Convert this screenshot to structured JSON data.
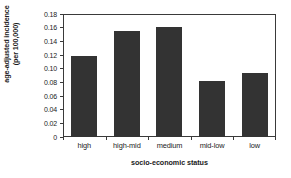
{
  "chart_data": {
    "type": "bar",
    "title": "",
    "xlabel": "socio-economic status",
    "ylabel_line1": "age-adjusted incidence",
    "ylabel_line2": "(per 100,000)",
    "categories": [
      "high",
      "high-mid",
      "medium",
      "mid-low",
      "low"
    ],
    "values": [
      0.118,
      0.155,
      0.161,
      0.082,
      0.094
    ],
    "ylim": [
      0,
      0.18
    ],
    "ytick_labels": [
      "0.18",
      "0.16",
      "0.14",
      "0.12",
      "0.10",
      "0.08",
      "0.06",
      "0.04",
      "0.02",
      "0"
    ],
    "ytick_values": [
      0.18,
      0.16,
      0.14,
      0.12,
      0.1,
      0.08,
      0.06,
      0.04,
      0.02,
      0
    ],
    "grid": false,
    "legend": false,
    "legend_position": "none",
    "bar_color": "#333333",
    "axis_color": "#3a3a3a",
    "background_color": "#ffffff"
  }
}
